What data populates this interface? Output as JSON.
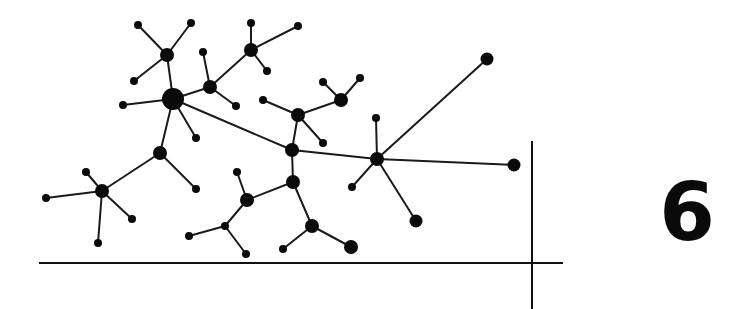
{
  "figure": {
    "label": "6",
    "colors": {
      "ink": "#0a0a0a",
      "background": "#ffffff"
    }
  },
  "axes": {
    "horizontal": {
      "x1": 39,
      "y1": 263,
      "x2": 563,
      "y2": 263
    },
    "vertical": {
      "x1": 532,
      "y1": 141,
      "x2": 532,
      "y2": 309
    }
  },
  "graph": {
    "nodes": [
      {
        "id": "A",
        "x": 173,
        "y": 99,
        "r": 11
      },
      {
        "id": "B",
        "x": 167,
        "y": 55,
        "r": 7
      },
      {
        "id": "B1",
        "x": 138,
        "y": 25,
        "r": 4
      },
      {
        "id": "B2",
        "x": 191,
        "y": 23,
        "r": 4
      },
      {
        "id": "B3",
        "x": 134,
        "y": 81,
        "r": 4
      },
      {
        "id": "C",
        "x": 123,
        "y": 105,
        "r": 4
      },
      {
        "id": "D",
        "x": 210,
        "y": 87,
        "r": 7
      },
      {
        "id": "D1",
        "x": 203,
        "y": 52,
        "r": 4
      },
      {
        "id": "D2",
        "x": 236,
        "y": 106,
        "r": 4
      },
      {
        "id": "E",
        "x": 251,
        "y": 50,
        "r": 7
      },
      {
        "id": "E1",
        "x": 251,
        "y": 23,
        "r": 4
      },
      {
        "id": "E2",
        "x": 298,
        "y": 26,
        "r": 4
      },
      {
        "id": "E3",
        "x": 267,
        "y": 71,
        "r": 4
      },
      {
        "id": "F",
        "x": 196,
        "y": 138,
        "r": 4
      },
      {
        "id": "G",
        "x": 160,
        "y": 153,
        "r": 7
      },
      {
        "id": "G1",
        "x": 196,
        "y": 189,
        "r": 4
      },
      {
        "id": "H",
        "x": 102,
        "y": 191,
        "r": 7
      },
      {
        "id": "H1",
        "x": 86,
        "y": 172,
        "r": 4
      },
      {
        "id": "H2",
        "x": 46,
        "y": 198,
        "r": 4
      },
      {
        "id": "H3",
        "x": 132,
        "y": 219,
        "r": 4
      },
      {
        "id": "H4",
        "x": 98,
        "y": 243,
        "r": 4
      },
      {
        "id": "I",
        "x": 292,
        "y": 150,
        "r": 7
      },
      {
        "id": "J",
        "x": 298,
        "y": 115,
        "r": 7
      },
      {
        "id": "J1",
        "x": 263,
        "y": 100,
        "r": 4
      },
      {
        "id": "J2",
        "x": 323,
        "y": 143,
        "r": 4
      },
      {
        "id": "K",
        "x": 341,
        "y": 100,
        "r": 7
      },
      {
        "id": "K1",
        "x": 323,
        "y": 82,
        "r": 4
      },
      {
        "id": "K2",
        "x": 360,
        "y": 78,
        "r": 4
      },
      {
        "id": "L",
        "x": 377,
        "y": 159,
        "r": 7
      },
      {
        "id": "L1",
        "x": 376,
        "y": 118,
        "r": 4
      },
      {
        "id": "L2",
        "x": 352,
        "y": 187,
        "r": 4
      },
      {
        "id": "M",
        "x": 487,
        "y": 59,
        "r": 6.5
      },
      {
        "id": "N",
        "x": 514,
        "y": 165,
        "r": 6.5
      },
      {
        "id": "O",
        "x": 416,
        "y": 221,
        "r": 6.5
      },
      {
        "id": "P",
        "x": 293,
        "y": 182,
        "r": 7
      },
      {
        "id": "Q",
        "x": 247,
        "y": 200,
        "r": 7
      },
      {
        "id": "Q1",
        "x": 237,
        "y": 172,
        "r": 4
      },
      {
        "id": "R",
        "x": 225,
        "y": 226,
        "r": 4
      },
      {
        "id": "R1",
        "x": 189,
        "y": 236,
        "r": 4
      },
      {
        "id": "R2",
        "x": 246,
        "y": 254,
        "r": 4
      },
      {
        "id": "S",
        "x": 312,
        "y": 226,
        "r": 7
      },
      {
        "id": "S1",
        "x": 283,
        "y": 249,
        "r": 4
      },
      {
        "id": "S2",
        "x": 351,
        "y": 247,
        "r": 7
      }
    ],
    "edges": [
      [
        "A",
        "B"
      ],
      [
        "B",
        "B1"
      ],
      [
        "B",
        "B2"
      ],
      [
        "B",
        "B3"
      ],
      [
        "A",
        "C"
      ],
      [
        "A",
        "D"
      ],
      [
        "D",
        "D1"
      ],
      [
        "D",
        "D2"
      ],
      [
        "D",
        "E"
      ],
      [
        "E",
        "E1"
      ],
      [
        "E",
        "E2"
      ],
      [
        "E",
        "E3"
      ],
      [
        "A",
        "F"
      ],
      [
        "A",
        "G"
      ],
      [
        "G",
        "G1"
      ],
      [
        "G",
        "H"
      ],
      [
        "H",
        "H1"
      ],
      [
        "H",
        "H2"
      ],
      [
        "H",
        "H3"
      ],
      [
        "H",
        "H4"
      ],
      [
        "A",
        "I"
      ],
      [
        "I",
        "J"
      ],
      [
        "J",
        "J1"
      ],
      [
        "J",
        "J2"
      ],
      [
        "J",
        "K"
      ],
      [
        "K",
        "K1"
      ],
      [
        "K",
        "K2"
      ],
      [
        "I",
        "L"
      ],
      [
        "L",
        "L1"
      ],
      [
        "L",
        "L2"
      ],
      [
        "L",
        "M"
      ],
      [
        "L",
        "N"
      ],
      [
        "L",
        "O"
      ],
      [
        "I",
        "P"
      ],
      [
        "P",
        "Q"
      ],
      [
        "Q",
        "Q1"
      ],
      [
        "Q",
        "R"
      ],
      [
        "R",
        "R1"
      ],
      [
        "R",
        "R2"
      ],
      [
        "P",
        "S"
      ],
      [
        "S",
        "S1"
      ],
      [
        "S",
        "S2"
      ]
    ]
  }
}
